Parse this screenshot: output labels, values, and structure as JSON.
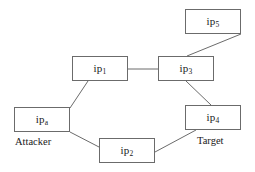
{
  "diagram": {
    "type": "network-attack-path-graph",
    "canvas": {
      "width": 255,
      "height": 172,
      "background": "#ffffff"
    },
    "edge_color": "#6b6b6b",
    "node_border_color": "#6b6b6b",
    "nodes": [
      {
        "id": "ip5",
        "base": "ip",
        "subscript": "5",
        "x": 185,
        "y": 9,
        "w": 56,
        "h": 25
      },
      {
        "id": "ip1",
        "base": "ip",
        "subscript": "1",
        "x": 72,
        "y": 56,
        "w": 56,
        "h": 25
      },
      {
        "id": "ip3",
        "base": "ip",
        "subscript": "3",
        "x": 158,
        "y": 56,
        "w": 56,
        "h": 25
      },
      {
        "id": "ipa",
        "base": "ip",
        "subscript": "a",
        "x": 14,
        "y": 107,
        "w": 56,
        "h": 25
      },
      {
        "id": "ip4",
        "base": "ip",
        "subscript": "4",
        "x": 185,
        "y": 105,
        "w": 56,
        "h": 25
      },
      {
        "id": "ip2",
        "base": "ip",
        "subscript": "2",
        "x": 99,
        "y": 138,
        "w": 56,
        "h": 25
      }
    ],
    "edges": [
      {
        "id": "e-ip1-ip3",
        "from": "ip1",
        "to": "ip3",
        "x1": 128,
        "y1": 69,
        "x2": 158,
        "y2": 69
      },
      {
        "id": "e-ip5-ip3",
        "from": "ip5",
        "to": "ip3",
        "x1": 241,
        "y1": 34,
        "x2": 187,
        "y2": 56
      },
      {
        "id": "e-ipa-ip1",
        "from": "ipa",
        "to": "ip1",
        "x1": 70,
        "y1": 108,
        "x2": 88,
        "y2": 81
      },
      {
        "id": "e-ip3-ip4",
        "from": "ip3",
        "to": "ip4",
        "x1": 186,
        "y1": 81,
        "x2": 211,
        "y2": 105
      },
      {
        "id": "e-ipa-ip2",
        "from": "ipa",
        "to": "ip2",
        "x1": 70,
        "y1": 132,
        "x2": 99,
        "y2": 147
      },
      {
        "id": "e-ip2-ip4",
        "from": "ip2",
        "to": "ip4",
        "x1": 155,
        "y1": 152,
        "x2": 196,
        "y2": 130
      }
    ],
    "captions": [
      {
        "id": "attacker",
        "text": "Attacker",
        "x": 15,
        "y": 136
      },
      {
        "id": "target",
        "text": "Target",
        "x": 197,
        "y": 135
      }
    ]
  }
}
